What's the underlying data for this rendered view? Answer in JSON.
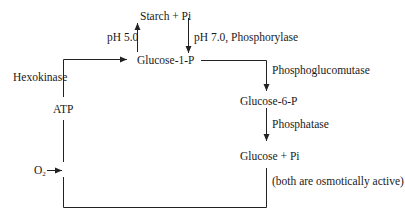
{
  "diagram": {
    "nodes": {
      "starch": "Starch + Pi",
      "g1p": "Glucose-1-P",
      "g6p": "Glucose-6-P",
      "glucose_pi": "Glucose + Pi",
      "atp": "ATP",
      "o2_base": "O",
      "o2_sub": "2"
    },
    "edge_labels": {
      "ph5": "pH 5.0",
      "ph7": "pH 7.0, Phosphorylase",
      "hexokinase": "Hexokinase",
      "phosphoglucomutase": "Phosphoglucomutase",
      "phosphatase": "Phosphatase",
      "note": "(both are osmotically active)"
    },
    "colors": {
      "line": "#222222",
      "text": "#1a1a1a",
      "background": "#ffffff"
    }
  }
}
